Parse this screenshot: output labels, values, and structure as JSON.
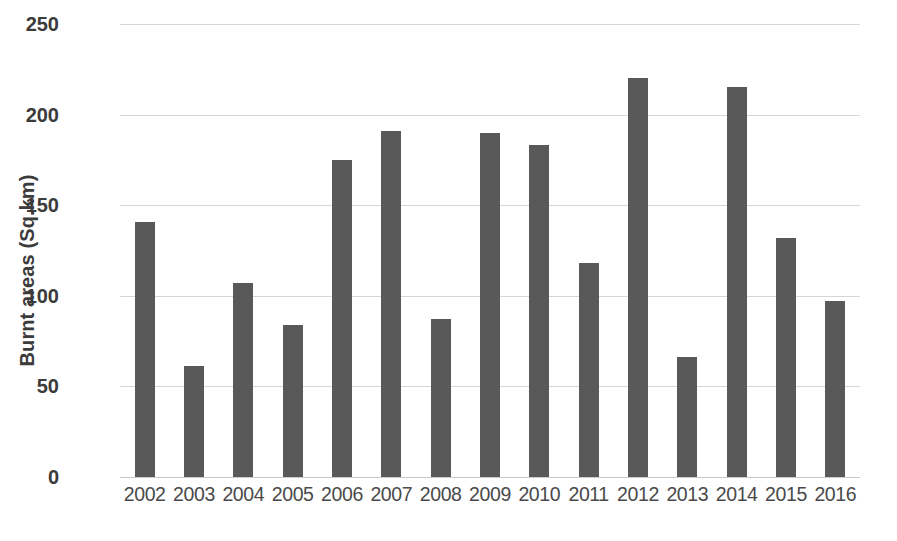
{
  "chart_data": {
    "type": "bar",
    "title": "",
    "xlabel": "",
    "ylabel": "Burnt areas (Sq.km)",
    "categories": [
      "2002",
      "2003",
      "2004",
      "2005",
      "2006",
      "2007",
      "2008",
      "2009",
      "2010",
      "2011",
      "2012",
      "2013",
      "2014",
      "2015",
      "2016"
    ],
    "values": [
      141,
      61,
      107,
      84,
      175,
      191,
      87,
      190,
      183,
      118,
      220,
      66,
      215,
      132,
      97
    ],
    "ylim": [
      0,
      250
    ],
    "yticks": [
      0,
      50,
      100,
      150,
      200,
      250
    ],
    "ytick_labels": [
      "0",
      "50",
      "100",
      "150",
      "200",
      "250"
    ],
    "grid": true,
    "legend": false,
    "series": [
      {
        "name": "Burnt areas",
        "values": [
          141,
          61,
          107,
          84,
          175,
          191,
          87,
          190,
          183,
          118,
          220,
          66,
          215,
          132,
          97
        ]
      }
    ],
    "colors": {
      "bar": "#595959",
      "gridline": "#d6d6d6",
      "axis_text": "#3b3b3b",
      "xtick_text": "#4a4a4a",
      "background": "#ffffff"
    }
  }
}
